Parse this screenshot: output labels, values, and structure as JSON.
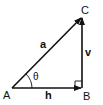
{
  "diagram": {
    "type": "right-triangle-vectors",
    "points": {
      "A": {
        "label": "A",
        "x": 12,
        "y": 88
      },
      "B": {
        "label": "B",
        "x": 82,
        "y": 88
      },
      "C": {
        "label": "C",
        "x": 82,
        "y": 17
      }
    },
    "vectors": [
      {
        "name": "a",
        "label": "a",
        "from": "A",
        "to": "C"
      },
      {
        "name": "h",
        "label": "h",
        "from": "A",
        "to": "B"
      },
      {
        "name": "v",
        "label": "v",
        "from": "B",
        "to": "C"
      }
    ],
    "angle": {
      "label": "θ",
      "at": "A"
    },
    "right_angle_at": "B",
    "colors": {
      "stroke": "#111111",
      "background": "#ffffff"
    }
  }
}
